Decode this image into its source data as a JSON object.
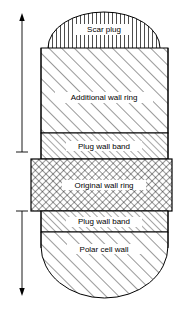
{
  "figure": {
    "title_present": false,
    "background_color": "#ffffff",
    "line_color": "#000000",
    "regions": [
      {
        "id": "scar-plug",
        "label": "Scar plug",
        "hatch": "vertical-lines",
        "shape": "dome",
        "label_x": 104,
        "label_y": 29
      },
      {
        "id": "additional-wall-ring",
        "label": "Additional wall ring",
        "hatch": "diagonal-coarse",
        "shape": "rectangle",
        "label_x": 104,
        "label_y": 97
      },
      {
        "id": "plug-wall-band-upper",
        "label": "Plug wall band",
        "hatch": "diagonal-fine",
        "shape": "rectangle",
        "label_x": 104,
        "label_y": 146
      },
      {
        "id": "original-wall-ring",
        "label": "Original wall ring",
        "hatch": "cross-hatch",
        "shape": "rectangle-wide",
        "label_x": 104,
        "label_y": 185
      },
      {
        "id": "plug-wall-band-lower",
        "label": "Plug wall band",
        "hatch": "diagonal-fine",
        "shape": "rectangle",
        "label_x": 104,
        "label_y": 222
      },
      {
        "id": "polar-cell-wall",
        "label": "Polar cell wall",
        "hatch": "diagonal-coarse",
        "shape": "rounded-bottom",
        "label_x": 104,
        "label_y": 249
      }
    ],
    "dimension_arrows": [
      {
        "id": "upper-dimension-arrow",
        "direction": "up",
        "x": 22,
        "from_y": 152,
        "to_y": 15
      },
      {
        "id": "lower-dimension-arrow",
        "direction": "down",
        "x": 22,
        "from_y": 211,
        "to_y": 296
      }
    ]
  }
}
